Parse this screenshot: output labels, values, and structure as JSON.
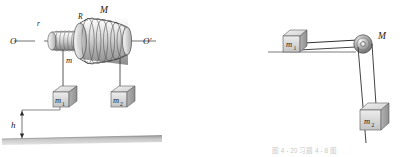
{
  "figure": {
    "title_caption": "图 4 - 20   习题 4 - 8 图",
    "background_color": "#ffffff",
    "ink_color": "#1a1a1a",
    "metal_light": "#e8e8e8",
    "metal_mid": "#bdbdbd",
    "metal_dark": "#8a8a8a",
    "ground_color": "#b5b5b5"
  },
  "left_diagram": {
    "name": "stepped-cone-pulley-with-two-hanging-masses",
    "axis_left_label": "O",
    "axis_right_label": "O'",
    "small_radius_label": "r",
    "large_radius_label": "R",
    "wheel_mass_label": "M",
    "small_drum_mass_label": "m",
    "block_1_label": "m",
    "block_1_sub": "1",
    "block_2_label": "m",
    "block_2_sub": "2",
    "height_label": "h"
  },
  "right_diagram": {
    "name": "pulley-with-block-on-table-and-hanging-mass",
    "pulley_label": "M",
    "block_1_label": "m",
    "block_1_sub": "1",
    "block_2_label": "m",
    "block_2_sub": "2"
  }
}
